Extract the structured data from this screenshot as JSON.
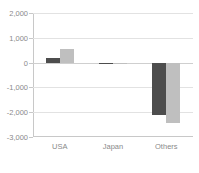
{
  "chart_data": {
    "type": "bar",
    "title": "",
    "subtitle": "",
    "xlabel": "",
    "ylabel": "",
    "categories": [
      "USA",
      "Japan",
      "Others"
    ],
    "series": [
      {
        "name": "Series 1",
        "color": "#4d4d4d",
        "values": [
          180,
          -30,
          -2100
        ]
      },
      {
        "name": "Series 2",
        "color": "#bfbfbf",
        "values": [
          550,
          -20,
          -2450
        ]
      }
    ],
    "ylim": [
      -3000,
      2000
    ],
    "ytick_labels": [
      "2,000",
      "1,000",
      "0",
      "-1,000",
      "-2,000",
      "-3,000"
    ],
    "ytick_values": [
      2000,
      1000,
      0,
      -1000,
      -2000,
      -3000
    ],
    "grid": true,
    "legend": "none",
    "axis_color": "#c8c8c8",
    "grid_color": "#e2e2e2",
    "tick_label_color": "#8a8a8a",
    "background": "#ffffff"
  }
}
